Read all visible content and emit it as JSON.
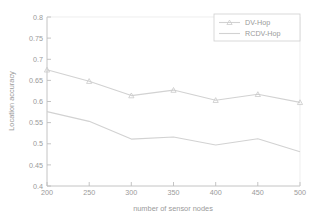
{
  "chart_data": {
    "type": "line",
    "title": "",
    "xlabel": "number of sensor nodes",
    "ylabel": "Location accuracy",
    "x": [
      200,
      250,
      300,
      350,
      400,
      450,
      500
    ],
    "xlim": [
      200,
      500
    ],
    "ylim": [
      0.4,
      0.8
    ],
    "xticks": [
      "200",
      "250",
      "300",
      "350",
      "400",
      "450",
      "500"
    ],
    "yticks": [
      "0.8",
      "0.75",
      "0.7",
      "0.65",
      "0.6",
      "0.55",
      "0.5",
      "0.45",
      "0.4"
    ],
    "grid": false,
    "legend_position": "upper right",
    "series": [
      {
        "name": "DV-Hop",
        "marker": "triangle",
        "color": "#d2d2d2",
        "values": [
          0.675,
          0.648,
          0.614,
          0.627,
          0.603,
          0.617,
          0.598
        ]
      },
      {
        "name": "RCDV-Hop",
        "marker": "none",
        "color": "#d2d2d2",
        "values": [
          0.576,
          0.553,
          0.511,
          0.516,
          0.497,
          0.512,
          0.481
        ]
      }
    ]
  },
  "axes": {
    "x_title": "number of sensor nodes",
    "y_title": "Location accuracy",
    "x_tick_labels": [
      "200",
      "250",
      "300",
      "350",
      "400",
      "450",
      "500"
    ],
    "y_tick_labels": [
      "0.8",
      "0.75",
      "0.7",
      "0.65",
      "0.6",
      "0.55",
      "0.5",
      "0.45",
      "0.4"
    ]
  },
  "legend": {
    "entries": [
      {
        "label": "DV-Hop"
      },
      {
        "label": "RCDV-Hop"
      }
    ]
  },
  "colors": {
    "line": "#d2d2d2",
    "axis": "#bdbdbd",
    "text": "#9a9a9a",
    "background": "#ffffff"
  }
}
